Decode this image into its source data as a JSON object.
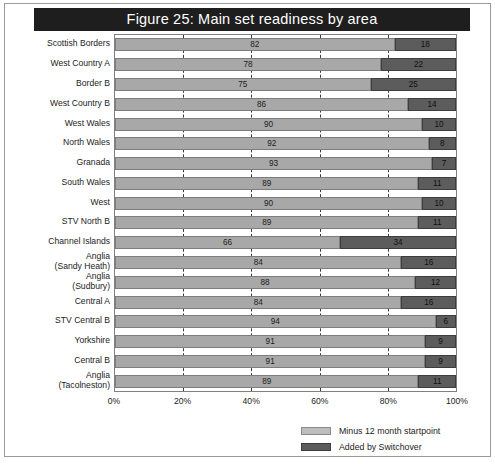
{
  "figure": {
    "title": "Figure 25: Main set readiness by area"
  },
  "chart_data": {
    "type": "bar",
    "orientation": "horizontal",
    "stacked": true,
    "title": "Figure 25: Main set readiness by area",
    "xlabel": "",
    "ylabel": "",
    "xlim": [
      0,
      100
    ],
    "xticks": [
      "0%",
      "20%",
      "40%",
      "60%",
      "80%",
      "100%"
    ],
    "xtick_values": [
      0,
      20,
      40,
      60,
      80,
      100
    ],
    "grid": "vertical-dashed",
    "legend_position": "bottom-right",
    "categories": [
      "Scottish Borders",
      "West Country A",
      "Border B",
      "West Country B",
      "West Wales",
      "North Wales",
      "Granada",
      "South Wales",
      "West",
      "STV North B",
      "Channel Islands",
      "Anglia\n(Sandy Heath)",
      "Anglia\n(Sudbury)",
      "Central A",
      "STV Central B",
      "Yorkshire",
      "Central B",
      "Anglia\n(Tacolneston)"
    ],
    "series": [
      {
        "name": "Minus 12 month startpoint",
        "color": "#a8a8a8",
        "values": [
          82,
          78,
          75,
          86,
          90,
          92,
          93,
          89,
          90,
          89,
          66,
          84,
          88,
          84,
          94,
          91,
          91,
          89
        ]
      },
      {
        "name": "Added by Switchover",
        "color": "#5c5c5c",
        "values": [
          18,
          22,
          25,
          14,
          10,
          8,
          7,
          11,
          10,
          11,
          34,
          16,
          12,
          16,
          6,
          9,
          9,
          11
        ]
      }
    ]
  }
}
